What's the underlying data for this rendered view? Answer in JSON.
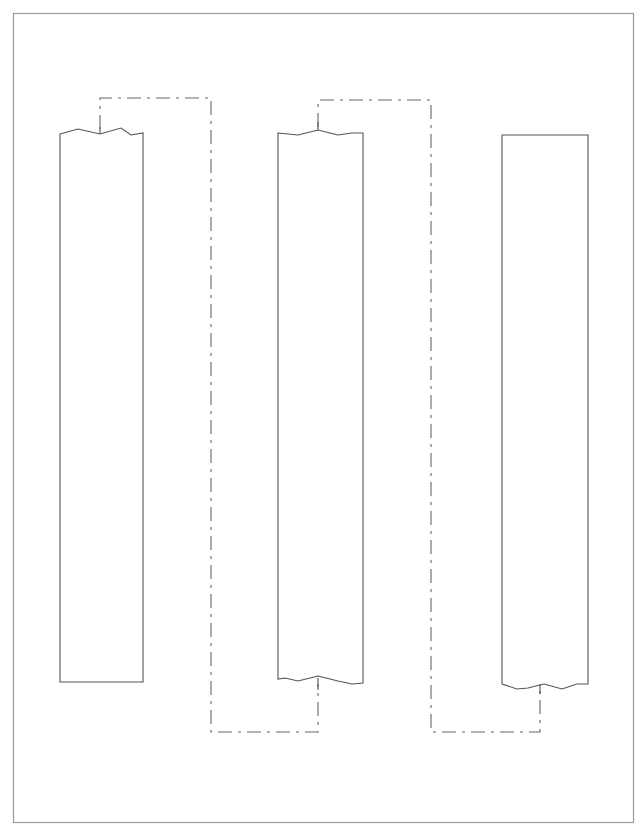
{
  "diagram": {
    "title": "",
    "type": "column-continuation-diagram",
    "frame": {
      "x": 13,
      "y": 13,
      "width": 620,
      "height": 809,
      "color": "#9a9a9a"
    },
    "columns": [
      {
        "id": "column-1",
        "x": 60,
        "width": 83,
        "top": 130,
        "bottom": 682,
        "top_edge": "break-line",
        "bottom_edge": "flat"
      },
      {
        "id": "column-2",
        "x": 278,
        "width": 85,
        "top": 130,
        "bottom": 682,
        "top_edge": "break-line",
        "bottom_edge": "break-line"
      },
      {
        "id": "column-3",
        "x": 502,
        "width": 86,
        "top": 135,
        "bottom": 685,
        "top_edge": "flat",
        "bottom_edge": "break-line"
      }
    ],
    "connectors": [
      {
        "id": "connector-1-to-2",
        "from": "column-1-top",
        "to": "column-2-bottom",
        "style": "dash-dot",
        "points": [
          [
            100,
            130
          ],
          [
            100,
            98
          ],
          [
            211,
            98
          ],
          [
            211,
            732
          ],
          [
            318,
            732
          ],
          [
            318,
            682
          ]
        ]
      },
      {
        "id": "connector-2-to-3",
        "from": "column-2-top",
        "to": "column-3-bottom",
        "style": "dash-dot",
        "points": [
          [
            318,
            130
          ],
          [
            318,
            100
          ],
          [
            431,
            100
          ],
          [
            431,
            732
          ],
          [
            540,
            732
          ],
          [
            540,
            686
          ]
        ]
      }
    ],
    "colors": {
      "background": "#ffffff",
      "column_stroke": "#555555",
      "connector_stroke": "#666666"
    }
  }
}
